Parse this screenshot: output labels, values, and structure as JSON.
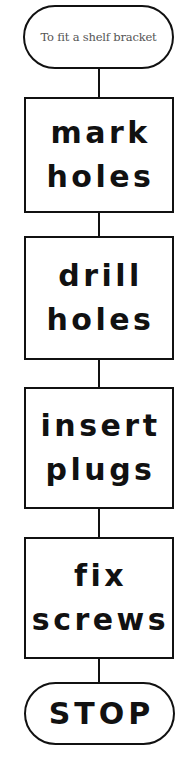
{
  "flowchart": {
    "start": {
      "label": "To fit a shelf bracket"
    },
    "steps": [
      {
        "lines": [
          "mark",
          "holes"
        ]
      },
      {
        "lines": [
          "drill",
          "holes"
        ]
      },
      {
        "lines": [
          "insert",
          "plugs"
        ]
      },
      {
        "lines": [
          "fix",
          "screws"
        ]
      }
    ],
    "end": {
      "label": "STOP"
    }
  },
  "colors": {
    "stroke": "#111111",
    "background": "#ffffff",
    "start_text": "#555555"
  }
}
